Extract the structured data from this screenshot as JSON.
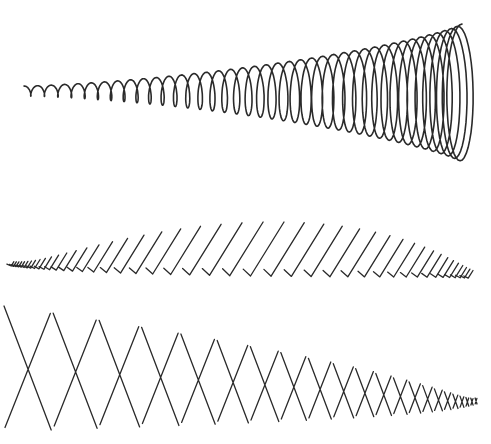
{
  "illustration": {
    "title": "",
    "ink_color": "#2a2a2a",
    "background": "#ffffff",
    "rows": [
      {
        "id": "spiral-coil",
        "kind": "loops",
        "count": 40,
        "size_trend": "increasing",
        "description": "Continuous overlapping loop spiral growing from small to large, left to right"
      },
      {
        "id": "check-strokes",
        "kind": "checks",
        "count": 44,
        "size_trend": "increase-then-decrease",
        "description": "Row of check-mark strokes rising to a peak in the middle then shrinking"
      },
      {
        "id": "cross-strokes",
        "kind": "crosses",
        "count": 22,
        "size_trend": "decreasing",
        "description": "Row of X crosses shrinking from large to tiny, left to right"
      }
    ]
  }
}
